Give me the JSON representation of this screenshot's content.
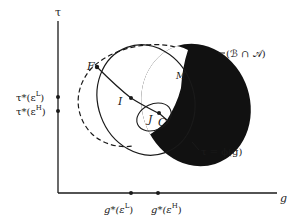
{
  "diagram": {
    "axes": {
      "y_label": "τ",
      "x_label": "g"
    },
    "y_ticks": [
      {
        "base": "τ*(ε",
        "sup": "L",
        "close": ")"
      },
      {
        "base": "τ*(ε",
        "sup": "H",
        "close": ")"
      }
    ],
    "x_ticks": [
      {
        "base": "g*(ε",
        "sup": "L",
        "close": ")"
      },
      {
        "base": "g*(ε",
        "sup": "H",
        "close": ")"
      }
    ],
    "points": {
      "F": "F",
      "I": "I",
      "J": "J",
      "C": "C",
      "M": "M"
    },
    "annotations": {
      "intersection": "(ℬ ∩ 𝒜)",
      "curve": "τ = ϕ(g)"
    },
    "colors": {
      "ink": "#1a1a1a",
      "background": "#ffffff"
    }
  }
}
